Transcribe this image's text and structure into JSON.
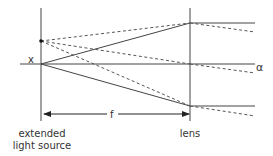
{
  "diagram": {
    "labels": {
      "source_point": "x",
      "axis_end": "α",
      "focal_length": "f",
      "source_line1": "extended",
      "source_line2": "light source",
      "lens": "lens"
    },
    "colors": {
      "line": "#444444",
      "text": "#333333"
    },
    "elements": {
      "source_plane_x": 41,
      "lens_plane_x": 190,
      "axis_y": 64,
      "off_axis_point": [
        41,
        41
      ],
      "lens_hit_points_y": [
        23,
        64,
        106
      ]
    }
  }
}
